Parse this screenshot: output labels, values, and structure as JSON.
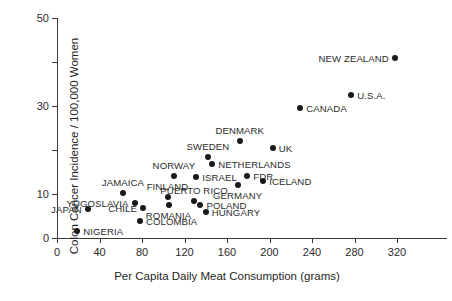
{
  "chart_data": {
    "type": "scatter",
    "title": "",
    "xlabel": "Per Capita Daily Meat Consumption (grams)",
    "ylabel": "Colon Cancer Incidence / 100,000 Women",
    "xlim": [
      0,
      320
    ],
    "ylim": [
      0,
      50
    ],
    "grid": false,
    "legend": "none",
    "xticks": [
      0,
      40,
      80,
      120,
      160,
      200,
      240,
      280,
      320
    ],
    "xtick_labels": [
      "0",
      "40",
      "80",
      "120",
      "160",
      "200",
      "240",
      "280",
      "320"
    ],
    "yticks": [
      0,
      10,
      20,
      30,
      40,
      50
    ],
    "ytick_labels": [
      "0",
      "10",
      "",
      "30",
      "",
      "50"
    ],
    "points": [
      {
        "label": "NIGERIA",
        "x": 19,
        "y": 1.5,
        "anchor": "right"
      },
      {
        "label": "JAPAN",
        "x": 29,
        "y": 6.5,
        "anchor": "left"
      },
      {
        "label": "JAMAICA",
        "x": 62,
        "y": 10.3,
        "anchor": "above"
      },
      {
        "label": "YUGOSLAVIA",
        "x": 73,
        "y": 8.0,
        "anchor": "left"
      },
      {
        "label": "CHILE",
        "x": 81,
        "y": 6.8,
        "anchor": "left"
      },
      {
        "label": "COLOMBIA",
        "x": 78,
        "y": 3.8,
        "anchor": "right"
      },
      {
        "label": "FINLAND",
        "x": 104,
        "y": 9.3,
        "anchor": "above"
      },
      {
        "label": "ROMANIA",
        "x": 105,
        "y": 7.5,
        "anchor": "below"
      },
      {
        "label": "NORWAY",
        "x": 110,
        "y": 14.0,
        "anchor": "above"
      },
      {
        "label": "PUERTO RICO",
        "x": 129,
        "y": 8.3,
        "anchor": "above"
      },
      {
        "label": "POLAND",
        "x": 135,
        "y": 7.4,
        "anchor": "right"
      },
      {
        "label": "HUNGARY",
        "x": 140,
        "y": 6.0,
        "anchor": "right"
      },
      {
        "label": "ISRAEL",
        "x": 131,
        "y": 13.8,
        "anchor": "right"
      },
      {
        "label": "SWEDEN",
        "x": 142,
        "y": 18.5,
        "anchor": "above"
      },
      {
        "label": "NETHERLANDS",
        "x": 146,
        "y": 16.8,
        "anchor": "right"
      },
      {
        "label": "GERMANY",
        "x": 170,
        "y": 12.0,
        "anchor": "below"
      },
      {
        "label": "FDR",
        "x": 179,
        "y": 14.2,
        "anchor": "right"
      },
      {
        "label": "ICELAND",
        "x": 194,
        "y": 13.0,
        "anchor": "right"
      },
      {
        "label": "DENMARK",
        "x": 172,
        "y": 22.0,
        "anchor": "above"
      },
      {
        "label": "UK",
        "x": 203,
        "y": 20.5,
        "anchor": "right"
      },
      {
        "label": "CANADA",
        "x": 229,
        "y": 29.6,
        "anchor": "right"
      },
      {
        "label": "U.S.A.",
        "x": 277,
        "y": 32.6,
        "anchor": "right"
      },
      {
        "label": "NEW ZEALAND",
        "x": 318,
        "y": 41.0,
        "anchor": "left"
      }
    ]
  },
  "colors": {
    "point": "#1a1a1a",
    "axis": "#3a3a3a",
    "text": "#2b2b2b",
    "background": "#ffffff"
  }
}
